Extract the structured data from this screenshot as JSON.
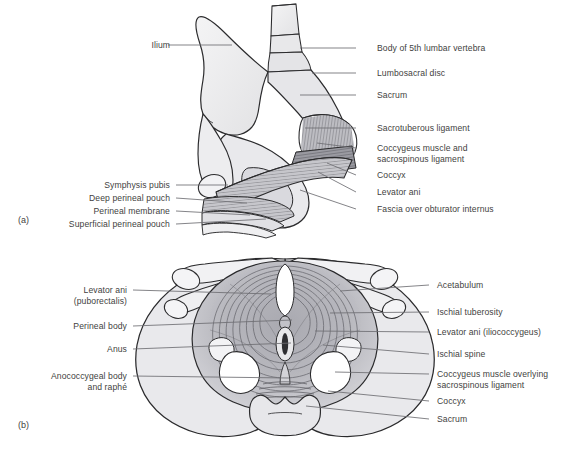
{
  "figure": {
    "background_color": "#ffffff",
    "text_color": "#3f3f41",
    "leader_line_color": "#6e6e72",
    "outline_color": "#2b2b2d",
    "bone_fill": "#ededee",
    "muscle_fill": "#c8c8cc",
    "muscle_dark_fill": "#8e8e94"
  },
  "panels": [
    {
      "tag": "(a)",
      "tag_x": 18,
      "tag_y": 215,
      "view": "oblique lateral view of hemipelvis",
      "labels_left": [
        {
          "text": "Ilium",
          "x": 137,
          "y": 40,
          "align": "right",
          "leader": [
            [
              168,
              45
            ],
            [
              232,
              45
            ]
          ]
        },
        {
          "text": "Symphysis pubis",
          "x": 92,
          "y": 180,
          "align": "right",
          "leader": [
            [
              176,
              185
            ],
            [
              228,
              185
            ]
          ]
        },
        {
          "text": "Deep perineal pouch",
          "x": 68,
          "y": 193,
          "align": "right",
          "leader": [
            [
              176,
              198
            ],
            [
              247,
              203
            ]
          ]
        },
        {
          "text": "Perineal membrane",
          "x": 74,
          "y": 206,
          "align": "right",
          "leader": [
            [
              176,
              211
            ],
            [
              250,
              215
            ]
          ]
        },
        {
          "text": "Superficial perineal pouch",
          "x": 53,
          "y": 219,
          "align": "right",
          "leader": [
            [
              176,
              224
            ],
            [
              266,
              219
            ]
          ]
        }
      ],
      "labels_right": [
        {
          "text": "Body of 5th lumbar vertebra",
          "x": 377,
          "y": 43,
          "align": "left",
          "leader": [
            [
              356,
              48
            ],
            [
              300,
              48
            ]
          ]
        },
        {
          "text": "Lumbosacral disc",
          "x": 377,
          "y": 68,
          "align": "left",
          "leader": [
            [
              356,
              73
            ],
            [
              312,
              73
            ]
          ]
        },
        {
          "text": "Sacrum",
          "x": 377,
          "y": 90,
          "align": "left",
          "leader": [
            [
              356,
              95
            ],
            [
              300,
              95
            ]
          ]
        },
        {
          "text": "Sacrotuberous ligament",
          "x": 377,
          "y": 123,
          "align": "left",
          "leader": [
            [
              356,
              128
            ],
            [
              305,
              128
            ]
          ]
        },
        {
          "text": "Coccygeus muscle and",
          "text2": "sacrospinous ligament",
          "x": 377,
          "y": 143,
          "align": "left",
          "leader": [
            [
              356,
              148
            ],
            [
              317,
              143
            ]
          ]
        },
        {
          "text": "Coccyx",
          "x": 377,
          "y": 170,
          "align": "left",
          "leader": [
            [
              356,
              175
            ],
            [
              327,
              163
            ]
          ]
        },
        {
          "text": "Levator ani",
          "x": 377,
          "y": 187,
          "align": "left",
          "leader": [
            [
              356,
              192
            ],
            [
              318,
              172
            ]
          ]
        },
        {
          "text": "Fascia over obturator internus",
          "x": 377,
          "y": 204,
          "align": "left",
          "leader": [
            [
              356,
              209
            ],
            [
              300,
              190
            ]
          ]
        }
      ]
    },
    {
      "tag": "(b)",
      "tag_x": 18,
      "tag_y": 420,
      "view": "inferior view of pelvic outlet / pelvic floor",
      "labels_left": [
        {
          "text": "Levator ani",
          "text2": "(puborectalis)",
          "x": 42,
          "y": 285,
          "align": "right",
          "leader": [
            [
              133,
              290
            ],
            [
              271,
              294
            ]
          ]
        },
        {
          "text": "Perineal body",
          "x": 33,
          "y": 321,
          "align": "right",
          "leader": [
            [
              133,
              326
            ],
            [
              292,
              320
            ]
          ]
        },
        {
          "text": "Anus",
          "x": 78,
          "y": 344,
          "align": "right",
          "leader": [
            [
              133,
              349
            ],
            [
              291,
              343
            ]
          ]
        },
        {
          "text": "Anococcygeal body",
          "text2": "and raphé",
          "x": 10,
          "y": 371,
          "align": "right",
          "leader": [
            [
              133,
              376
            ],
            [
              289,
              378
            ]
          ]
        }
      ],
      "labels_right": [
        {
          "text": "Acetabulum",
          "x": 437,
          "y": 280,
          "align": "left",
          "leader": [
            [
              429,
              285
            ],
            [
              340,
              291
            ]
          ]
        },
        {
          "text": "Ischial tuberosity",
          "x": 437,
          "y": 307,
          "align": "left",
          "leader": [
            [
              429,
              312
            ],
            [
              330,
              313
            ]
          ]
        },
        {
          "text": "Levator ani (iliococcygeus)",
          "x": 437,
          "y": 327,
          "align": "left",
          "leader": [
            [
              429,
              332
            ],
            [
              315,
              331
            ]
          ]
        },
        {
          "text": "Ischial spine",
          "x": 437,
          "y": 349,
          "align": "left",
          "leader": [
            [
              429,
              354
            ],
            [
              323,
              345
            ]
          ]
        },
        {
          "text": "Coccygeus muscle overlying",
          "text2": "sacrospinous ligament",
          "x": 437,
          "y": 369,
          "align": "left",
          "leader": [
            [
              429,
              374
            ],
            [
              335,
              372
            ]
          ]
        },
        {
          "text": "Coccyx",
          "x": 437,
          "y": 396,
          "align": "left",
          "leader": [
            [
              429,
              401
            ],
            [
              328,
              391
            ]
          ]
        },
        {
          "text": "Sacrum",
          "x": 437,
          "y": 414,
          "align": "left",
          "leader": [
            [
              429,
              419
            ],
            [
              306,
              406
            ]
          ]
        }
      ]
    }
  ]
}
